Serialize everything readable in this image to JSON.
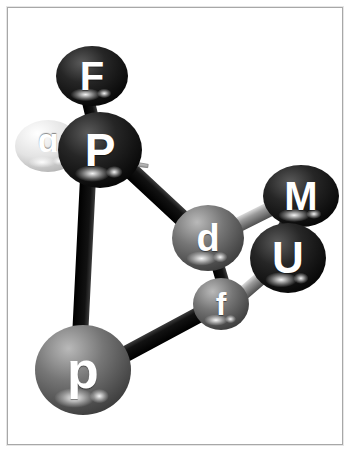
{
  "figure": {
    "background_color": "#ffffff",
    "frame_color": "#a8a8a8",
    "label_color": "#ffffff"
  },
  "nodes": [
    {
      "id": "F",
      "label": "F",
      "cx": 92,
      "cy": 76,
      "rx": 36,
      "ry": 30,
      "color": "#2d2d2d",
      "highlight": "#d8d8d8",
      "font_size": 40,
      "shade": "dark"
    },
    {
      "id": "a",
      "label": "ɒ",
      "cx": 48,
      "cy": 146,
      "rx": 33,
      "ry": 26,
      "color": "#dcdcdc",
      "highlight": "#ffffff",
      "font_size": 34,
      "shade": "light"
    },
    {
      "id": "P",
      "label": "P",
      "cx": 100,
      "cy": 150,
      "rx": 42,
      "ry": 38,
      "color": "#151515",
      "highlight": "#8a8a8a",
      "font_size": 46,
      "shade": "dark"
    },
    {
      "id": "d",
      "label": "d",
      "cx": 208,
      "cy": 238,
      "rx": 36,
      "ry": 33,
      "color": "#6e6e6e",
      "highlight": "#e4e4e4",
      "font_size": 38,
      "shade": "mid"
    },
    {
      "id": "M",
      "label": "M",
      "cx": 301,
      "cy": 196,
      "rx": 38,
      "ry": 31,
      "color": "#3a3a3a",
      "highlight": "#d0d0d0",
      "font_size": 40,
      "shade": "dark"
    },
    {
      "id": "U",
      "label": "U",
      "cx": 288,
      "cy": 258,
      "rx": 38,
      "ry": 35,
      "color": "#101010",
      "highlight": "#6a6a6a",
      "font_size": 44,
      "shade": "dark"
    },
    {
      "id": "f",
      "label": "f",
      "cx": 221,
      "cy": 304,
      "rx": 28,
      "ry": 26,
      "color": "#606060",
      "highlight": "#e0e0e0",
      "font_size": 32,
      "shade": "mid"
    },
    {
      "id": "p",
      "label": "p",
      "cx": 83,
      "cy": 370,
      "rx": 48,
      "ry": 45,
      "color": "#6a6a6a",
      "highlight": "#e8e8e8",
      "font_size": 52,
      "shade": "mid"
    }
  ],
  "bonds": [
    {
      "id": "F-P",
      "from": "F",
      "to": "P",
      "x1": 88,
      "y1": 100,
      "x2": 98,
      "y2": 142,
      "width": 13,
      "color": "#1a1a1a",
      "style": "dark-rod"
    },
    {
      "id": "P-p",
      "from": "P",
      "to": "p",
      "x1": 88,
      "y1": 178,
      "x2": 80,
      "y2": 338,
      "width": 16,
      "color": "#141414",
      "style": "dark-rod"
    },
    {
      "id": "P-d",
      "from": "P",
      "to": "d",
      "x1": 128,
      "y1": 168,
      "x2": 186,
      "y2": 222,
      "width": 17,
      "color": "#141414",
      "style": "dark-rod"
    },
    {
      "id": "p-f",
      "from": "p",
      "to": "f",
      "x1": 122,
      "y1": 356,
      "x2": 204,
      "y2": 312,
      "width": 16,
      "color": "#141414",
      "style": "dark-rod"
    },
    {
      "id": "d-M",
      "from": "d",
      "to": "M",
      "x1": 236,
      "y1": 226,
      "x2": 276,
      "y2": 206,
      "width": 15,
      "color": "#8c8c8c",
      "style": "gray-rod"
    },
    {
      "id": "d-f",
      "from": "d",
      "to": "f",
      "x1": 218,
      "y1": 266,
      "x2": 224,
      "y2": 286,
      "width": 13,
      "color": "#141414",
      "style": "dark-rod"
    },
    {
      "id": "f-U",
      "from": "f",
      "to": "U",
      "x1": 240,
      "y1": 296,
      "x2": 268,
      "y2": 272,
      "width": 14,
      "color": "#8c8c8c",
      "style": "gray-rod"
    },
    {
      "id": "U-M",
      "from": "U",
      "to": "M",
      "x1": 282,
      "y1": 230,
      "x2": 292,
      "y2": 212,
      "width": 12,
      "color": "#2a2a2a",
      "style": "dark-rod"
    },
    {
      "id": "a-P",
      "from": "a",
      "to": "P",
      "x1": 22,
      "y1": 148,
      "x2": 148,
      "y2": 166,
      "width": 10,
      "color": "#b8b8b8",
      "style": "taper-rod"
    }
  ]
}
